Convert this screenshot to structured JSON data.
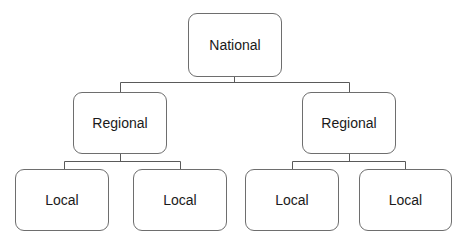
{
  "diagram": {
    "type": "org-hierarchy",
    "root": {
      "label": "National",
      "children": [
        {
          "label": "Regional",
          "children": [
            {
              "label": "Local"
            },
            {
              "label": "Local"
            }
          ]
        },
        {
          "label": "Regional",
          "children": [
            {
              "label": "Local"
            },
            {
              "label": "Local"
            }
          ]
        }
      ]
    }
  },
  "nodes": {
    "national": "National",
    "regional_left": "Regional",
    "regional_right": "Regional",
    "local_1": "Local",
    "local_2": "Local",
    "local_3": "Local",
    "local_4": "Local"
  },
  "colors": {
    "line": "#5a5a5a",
    "border": "#6e6e6e",
    "text": "#1a1a1a",
    "background": "#ffffff"
  }
}
